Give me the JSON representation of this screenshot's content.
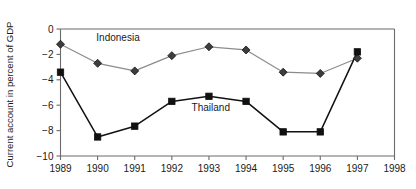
{
  "chart_data": {
    "type": "line",
    "title": "",
    "xlabel": "",
    "ylabel": "Current account in percent of GDP",
    "x": [
      1989,
      1990,
      1991,
      1992,
      1993,
      1994,
      1995,
      1996,
      1997,
      1998
    ],
    "xtick_labels": [
      "1989",
      "1990",
      "1991",
      "1992",
      "1993",
      "1994",
      "1995",
      "1996",
      "1997",
      "1998"
    ],
    "ytick_labels": [
      "0",
      "−2",
      "−4",
      "−6",
      "−8",
      "−10"
    ],
    "ytick_values": [
      0,
      -2,
      -4,
      -6,
      -8,
      -10
    ],
    "ylim": [
      -10,
      0
    ],
    "xlim": [
      1989,
      1998
    ],
    "grid": false,
    "legend": "inline-annotations",
    "series": [
      {
        "name": "Indonesia",
        "marker": "diamond",
        "color": "#3d3d3d",
        "line_color": "#8c8c8c",
        "x": [
          1989,
          1990,
          1991,
          1992,
          1993,
          1994,
          1995,
          1996,
          1997
        ],
        "values": [
          -1.2,
          -2.7,
          -3.3,
          -2.1,
          -1.4,
          -1.65,
          -3.4,
          -3.5,
          -2.3
        ],
        "label_x": 1990.55,
        "label_y": -0.95
      },
      {
        "name": "Thailand",
        "marker": "square",
        "color": "#111111",
        "line_color": "#111111",
        "x": [
          1989,
          1990,
          1991,
          1992,
          1993,
          1994,
          1995,
          1996,
          1997
        ],
        "values": [
          -3.4,
          -8.5,
          -7.65,
          -5.7,
          -5.3,
          -5.7,
          -8.1,
          -8.1,
          -1.8
        ],
        "label_x": 1993.05,
        "label_y": -6.45
      }
    ]
  }
}
